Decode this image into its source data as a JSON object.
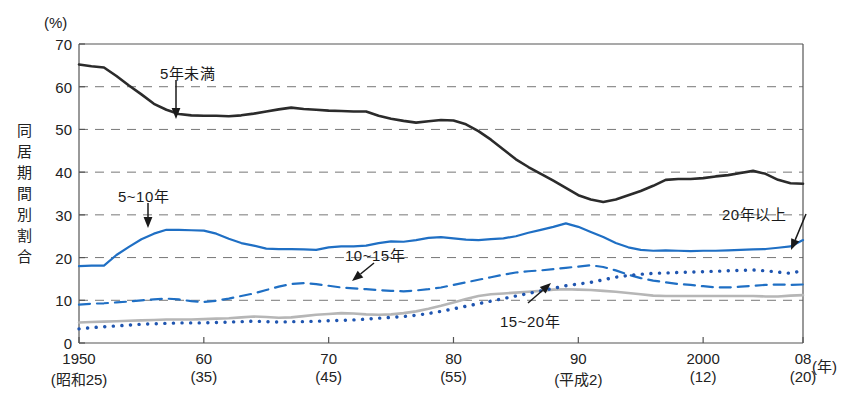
{
  "chart_data": {
    "type": "line",
    "title": "",
    "subtitle": "",
    "xlabel": "(年)",
    "ylabel": "同居期間別割合",
    "yunit": "(%)",
    "ylim": [
      0,
      70
    ],
    "xlim": [
      1950,
      2008
    ],
    "grid": "horizontal-dashed",
    "legend_position": "inline-annotations",
    "yticks": [
      0,
      10,
      20,
      30,
      40,
      50,
      60,
      70
    ],
    "ytick_labels": [
      "0",
      "10",
      "20",
      "30",
      "40",
      "50",
      "60",
      "70"
    ],
    "xticks": [
      1950,
      1960,
      1970,
      1980,
      1990,
      2000,
      2008
    ],
    "xtick_labels": [
      "1950",
      "60",
      "70",
      "80",
      "90",
      "2000",
      "08"
    ],
    "xtick_era_labels": [
      "(昭和25)",
      "(35)",
      "(45)",
      "(55)",
      "(平成2)",
      "(12)",
      "(20)"
    ],
    "x": [
      1950,
      1951,
      1952,
      1953,
      1954,
      1955,
      1956,
      1957,
      1958,
      1959,
      1960,
      1961,
      1962,
      1963,
      1964,
      1965,
      1966,
      1967,
      1968,
      1969,
      1970,
      1971,
      1972,
      1973,
      1974,
      1975,
      1976,
      1977,
      1978,
      1979,
      1980,
      1981,
      1982,
      1983,
      1984,
      1985,
      1986,
      1987,
      1988,
      1989,
      1990,
      1991,
      1992,
      1993,
      1994,
      1995,
      1996,
      1997,
      1998,
      1999,
      2000,
      2001,
      2002,
      2003,
      2004,
      2005,
      2006,
      2007,
      2008
    ],
    "series": [
      {
        "name": "5年未満",
        "label": "5年未満",
        "style": "solid",
        "color": "#2b2b2b",
        "width": 2.6,
        "values": [
          65.2,
          64.8,
          64.5,
          62.5,
          60.3,
          58.2,
          56.0,
          54.6,
          53.6,
          53.3,
          53.2,
          53.2,
          53.1,
          53.3,
          53.7,
          54.2,
          54.7,
          55.1,
          54.8,
          54.6,
          54.4,
          54.3,
          54.2,
          54.2,
          53.2,
          52.5,
          52.0,
          51.6,
          51.9,
          52.2,
          52.1,
          51.2,
          49.6,
          47.6,
          45.3,
          43.0,
          41.2,
          39.6,
          38.0,
          36.3,
          34.6,
          33.6,
          33.0,
          33.6,
          34.6,
          35.6,
          36.8,
          38.2,
          38.4,
          38.4,
          38.6,
          39.0,
          39.3,
          39.8,
          40.3,
          39.6,
          38.2,
          37.4,
          37.3
        ]
      },
      {
        "name": "5~10年",
        "label": "5~10年",
        "style": "solid",
        "color": "#1f6fc4",
        "width": 2.2,
        "values": [
          18.0,
          18.1,
          18.1,
          20.6,
          22.5,
          24.3,
          25.6,
          26.5,
          26.5,
          26.4,
          26.3,
          25.6,
          24.4,
          23.4,
          22.8,
          22.1,
          22.0,
          22.0,
          21.9,
          21.8,
          22.4,
          22.6,
          22.6,
          22.8,
          23.4,
          23.8,
          23.7,
          24.1,
          24.6,
          24.8,
          24.5,
          24.2,
          24.1,
          24.3,
          24.5,
          25.0,
          25.8,
          26.5,
          27.2,
          28.0,
          27.2,
          26.0,
          24.8,
          23.4,
          22.4,
          21.8,
          21.6,
          21.7,
          21.6,
          21.5,
          21.6,
          21.6,
          21.7,
          21.8,
          21.9,
          22.0,
          22.3,
          22.6,
          24.1
        ]
      },
      {
        "name": "10~15年",
        "label": "10~15年",
        "style": "dashed",
        "color": "#1f6fc4",
        "width": 2.2,
        "values": [
          9.0,
          9.2,
          9.3,
          9.5,
          9.7,
          10.0,
          10.2,
          10.4,
          10.2,
          9.8,
          9.6,
          9.9,
          10.4,
          11.0,
          11.6,
          12.4,
          13.2,
          13.8,
          14.0,
          13.8,
          13.4,
          13.0,
          12.8,
          12.6,
          12.4,
          12.2,
          12.1,
          12.3,
          12.6,
          13.0,
          13.6,
          14.2,
          14.8,
          15.4,
          16.0,
          16.5,
          16.8,
          17.0,
          17.3,
          17.6,
          17.9,
          18.2,
          17.8,
          17.0,
          16.0,
          15.2,
          14.6,
          14.2,
          13.8,
          13.6,
          13.3,
          13.0,
          13.0,
          13.2,
          13.4,
          13.6,
          13.7,
          13.6,
          13.7
        ]
      },
      {
        "name": "15~20年",
        "label": "15~20年",
        "style": "solid",
        "color": "#b6b6b6",
        "width": 2.6,
        "values": [
          4.8,
          4.9,
          5.0,
          5.1,
          5.2,
          5.3,
          5.4,
          5.5,
          5.5,
          5.5,
          5.6,
          5.7,
          5.8,
          6.0,
          6.2,
          6.1,
          5.9,
          6.0,
          6.3,
          6.6,
          6.8,
          7.0,
          6.9,
          6.7,
          6.6,
          6.7,
          7.0,
          7.4,
          8.0,
          8.7,
          9.5,
          10.3,
          11.0,
          11.4,
          11.6,
          11.8,
          12.0,
          12.2,
          12.5,
          12.6,
          12.5,
          12.4,
          12.2,
          12.0,
          11.7,
          11.4,
          11.1,
          11.0,
          11.0,
          11.0,
          11.0,
          11.0,
          11.0,
          11.0,
          11.0,
          10.9,
          10.9,
          11.1,
          11.2
        ]
      },
      {
        "name": "20年以上",
        "label": "20年以上",
        "style": "dotted",
        "color": "#1f55b0",
        "width": 3.4,
        "values": [
          3.3,
          3.6,
          3.8,
          4.0,
          4.2,
          4.4,
          4.5,
          4.6,
          4.7,
          4.7,
          4.7,
          4.8,
          4.9,
          5.0,
          5.1,
          5.0,
          4.9,
          5.0,
          5.0,
          5.1,
          5.2,
          5.3,
          5.4,
          5.6,
          5.8,
          6.0,
          6.2,
          6.5,
          6.9,
          7.4,
          8.0,
          8.6,
          9.2,
          9.8,
          10.4,
          11.0,
          11.6,
          12.2,
          12.8,
          13.4,
          13.8,
          14.2,
          14.8,
          15.4,
          15.8,
          16.1,
          16.3,
          16.4,
          16.5,
          16.6,
          16.7,
          16.8,
          16.9,
          17.0,
          17.1,
          16.9,
          16.6,
          16.3,
          17.0
        ]
      }
    ],
    "annotations": [
      {
        "id": "ann-5mi",
        "text": "5年未満",
        "label_x": 160,
        "label_y": 62,
        "arrow": "down"
      },
      {
        "id": "ann-5to10",
        "text": "5~10年",
        "label_x": 118,
        "label_y": 185,
        "arrow": "down"
      },
      {
        "id": "ann-10to15",
        "text": "10~15年",
        "label_x": 345,
        "label_y": 244,
        "arrow": "down-left"
      },
      {
        "id": "ann-15to20",
        "text": "15~20年",
        "label_x": 500,
        "label_y": 310,
        "arrow": "up-right"
      },
      {
        "id": "ann-20plus",
        "text": "20年以上",
        "label_x": 722,
        "label_y": 203,
        "arrow": "down-right"
      }
    ]
  }
}
